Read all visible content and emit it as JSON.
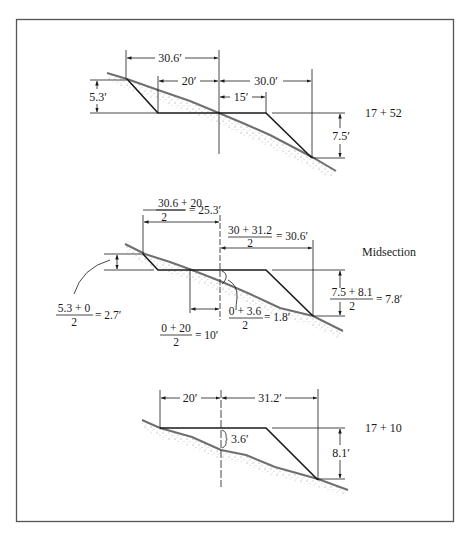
{
  "figure": {
    "frame_color": "#555555",
    "line_color": "#1a1a1a",
    "ground_color": "#6f6f6f"
  },
  "sections": [
    {
      "station": "17 + 52",
      "dims": {
        "left_total": "30.6′",
        "left_base": "20′",
        "right_total": "30.0′",
        "right_base": "15′",
        "left_height": "5.3′",
        "right_height": "7.5′"
      }
    },
    {
      "station": "Midsection",
      "dims": {
        "left_total_num": "30.6 + 20",
        "left_total_den": "2",
        "left_total_result": "= 25.3′",
        "right_total_num": "30 + 31.2",
        "right_total_den": "2",
        "right_total_result": "= 30.6′",
        "left_height_num": "5.3 + 0",
        "left_height_den": "2",
        "left_height_result": "= 2.7′",
        "left_base_num": "0 + 20",
        "left_base_den": "2",
        "left_base_result": "= 10′",
        "center_fill_num": "0 + 3.6",
        "center_fill_den": "2",
        "center_fill_result": "= 1.8′",
        "right_height_num": "7.5 + 8.1",
        "right_height_den": "2",
        "right_height_result": "= 7.8′"
      }
    },
    {
      "station": "17 + 10",
      "dims": {
        "left_total": "20′",
        "right_total": "31.2′",
        "center_fill": "3.6′",
        "right_height": "8.1′"
      }
    }
  ]
}
